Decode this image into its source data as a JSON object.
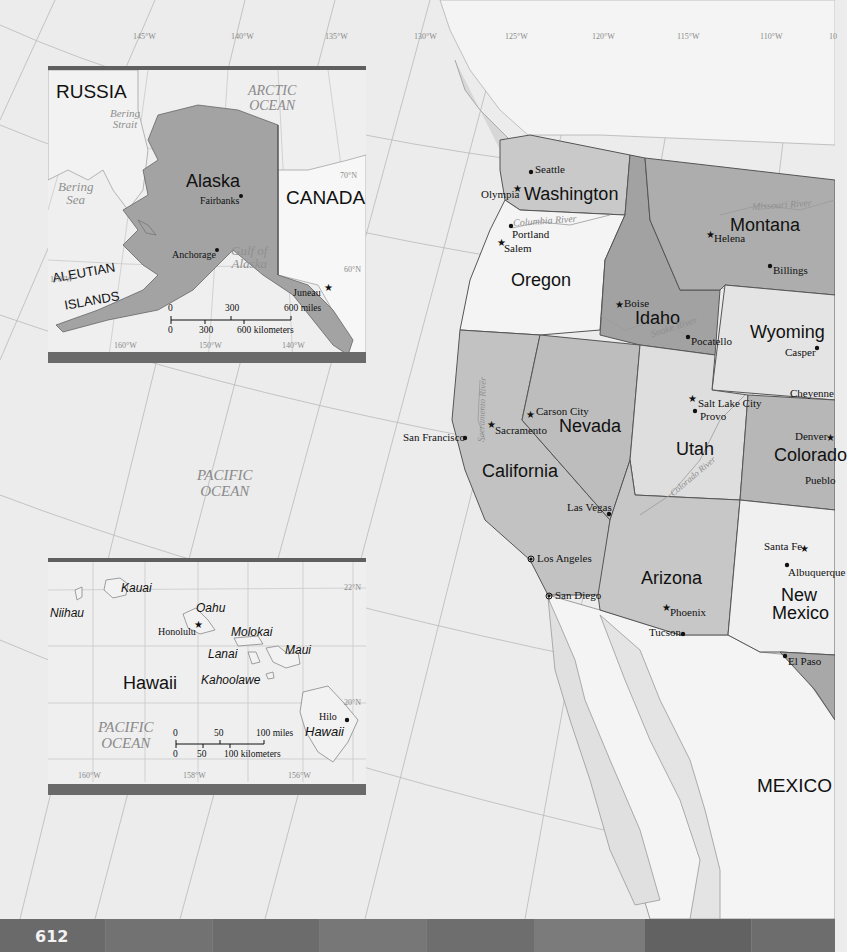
{
  "main_map": {
    "longitude_labels": [
      "145°W",
      "140°W",
      "135°W",
      "130°W",
      "125°W",
      "120°W",
      "115°W",
      "110°W",
      "10"
    ],
    "ocean_label": [
      "PACIFIC",
      "OCEAN"
    ],
    "country_label": "MEXICO",
    "states": [
      {
        "name": "Washington"
      },
      {
        "name": "Oregon"
      },
      {
        "name": "California"
      },
      {
        "name": "Nevada"
      },
      {
        "name": "Idaho"
      },
      {
        "name": "Montana"
      },
      {
        "name": "Wyoming"
      },
      {
        "name": "Utah"
      },
      {
        "name": "Colorado",
        "display": "Colorado"
      },
      {
        "name": "Arizona"
      },
      {
        "name": "New"
      },
      {
        "name": "Mexico"
      }
    ],
    "cities": [
      {
        "name": "Seattle",
        "type": "city"
      },
      {
        "name": "Olympia",
        "type": "capital"
      },
      {
        "name": "Portland",
        "type": "city"
      },
      {
        "name": "Salem",
        "type": "capital"
      },
      {
        "name": "Boise",
        "type": "capital"
      },
      {
        "name": "Pocatello",
        "type": "city"
      },
      {
        "name": "Helena",
        "type": "capital"
      },
      {
        "name": "Billings",
        "type": "city"
      },
      {
        "name": "Casper",
        "type": "city"
      },
      {
        "name": "Cheyenne",
        "type": "capital"
      },
      {
        "name": "Salt Lake City",
        "type": "capital"
      },
      {
        "name": "Provo",
        "type": "city"
      },
      {
        "name": "Denver",
        "type": "capital"
      },
      {
        "name": "Pueblo",
        "type": "city"
      },
      {
        "name": "Carson City",
        "type": "capital"
      },
      {
        "name": "Sacramento",
        "type": "capital"
      },
      {
        "name": "San Francisco",
        "type": "city"
      },
      {
        "name": "Las Vegas",
        "type": "city"
      },
      {
        "name": "Los Angeles",
        "type": "major-city"
      },
      {
        "name": "San Diego",
        "type": "major-city"
      },
      {
        "name": "Phoenix",
        "type": "capital"
      },
      {
        "name": "Tucson",
        "type": "city"
      },
      {
        "name": "Santa Fe",
        "type": "capital"
      },
      {
        "name": "Albuquerque",
        "type": "city"
      },
      {
        "name": "El Paso",
        "type": "city"
      }
    ],
    "rivers": [
      "Columbia River",
      "Missouri River",
      "Snake River",
      "Sacramento River",
      "Colorado River"
    ]
  },
  "alaska_inset": {
    "labels": {
      "russia": "RUSSIA",
      "arctic": [
        "ARCTIC",
        "OCEAN"
      ],
      "bering_strait": [
        "Bering",
        "Strait"
      ],
      "bering_sea": [
        "Bering",
        "Sea"
      ],
      "state": "Alaska",
      "canada": "CANADA",
      "gulf": [
        "Gulf of",
        "Alaska"
      ],
      "aleutian": [
        "ALEUTIAN",
        "ISLANDS"
      ]
    },
    "cities": [
      {
        "name": "Fairbanks",
        "type": "city"
      },
      {
        "name": "Anchorage",
        "type": "city"
      },
      {
        "name": "Juneau",
        "type": "capital"
      }
    ],
    "graticule": [
      "170°W",
      "160°W",
      "150°W",
      "140°W",
      "60°N",
      "70°N"
    ],
    "scale": {
      "miles_ticks": [
        "0",
        "300",
        "600 miles"
      ],
      "km_ticks": [
        "0",
        "300",
        "600 kilometers"
      ]
    }
  },
  "hawaii_inset": {
    "labels": {
      "state": "Hawaii",
      "ocean": [
        "PACIFIC",
        "OCEAN"
      ]
    },
    "islands": [
      "Niihau",
      "Kauai",
      "Oahu",
      "Molokai",
      "Lanai",
      "Maui",
      "Kahoolawe",
      "Hawaii"
    ],
    "cities": [
      {
        "name": "Honolulu",
        "type": "capital"
      },
      {
        "name": "Hilo",
        "type": "city"
      }
    ],
    "graticule": [
      "160°W",
      "158°W",
      "156°W",
      "22°N",
      "20°N"
    ],
    "scale": {
      "miles_ticks": [
        "0",
        "50",
        "100 miles"
      ],
      "km_ticks": [
        "0",
        "50",
        "100 kilometers"
      ]
    }
  },
  "footer": {
    "page_number": "612"
  },
  "colors": {
    "ocean": "#ececec",
    "us_mid_gray": "#bdbdbd",
    "us_dark_gray": "#9a9a9a",
    "us_light_gray": "#d4d4d4",
    "neighbor_white": "#f7f7f7",
    "inset_bar": "#6a6a6a",
    "footer": "#6e6e6e"
  }
}
